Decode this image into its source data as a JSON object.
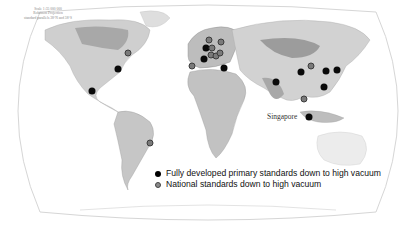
{
  "map": {
    "scale_note": [
      "Scale 1:35 000 000",
      "Robinson Projection",
      "standard parallels 38°N and 38°S"
    ],
    "labels": {
      "singapore": "Singapore"
    },
    "colors": {
      "land_light": "#d8d8d8",
      "land_mid": "#bcbcbc",
      "land_dark": "#9a9a9a",
      "ocean": "#ffffff",
      "primary_dot": "#0a0a0a",
      "national_dot": "#7a7a7a"
    },
    "dots": [
      {
        "type": "black",
        "x": 92,
        "y": 91
      },
      {
        "type": "black",
        "x": 118,
        "y": 69
      },
      {
        "type": "gray",
        "x": 128,
        "y": 53
      },
      {
        "type": "gray",
        "x": 150,
        "y": 143
      },
      {
        "type": "gray",
        "x": 192,
        "y": 66
      },
      {
        "type": "black",
        "x": 206,
        "y": 48
      },
      {
        "type": "black",
        "x": 204,
        "y": 59
      },
      {
        "type": "gray",
        "x": 209,
        "y": 40
      },
      {
        "type": "gray",
        "x": 212,
        "y": 48
      },
      {
        "type": "gray",
        "x": 221,
        "y": 42
      },
      {
        "type": "gray",
        "x": 211,
        "y": 55
      },
      {
        "type": "gray",
        "x": 216,
        "y": 56
      },
      {
        "type": "gray",
        "x": 220,
        "y": 53
      },
      {
        "type": "black",
        "x": 224,
        "y": 68
      },
      {
        "type": "black",
        "x": 276,
        "y": 82
      },
      {
        "type": "black",
        "x": 301,
        "y": 72
      },
      {
        "type": "gray",
        "x": 311,
        "y": 66
      },
      {
        "type": "black",
        "x": 326,
        "y": 71
      },
      {
        "type": "black",
        "x": 337,
        "y": 70
      },
      {
        "type": "black",
        "x": 324,
        "y": 87
      },
      {
        "type": "gray",
        "x": 304,
        "y": 99
      },
      {
        "type": "black",
        "x": 309,
        "y": 117
      }
    ]
  },
  "legend": {
    "items": [
      {
        "symbol": "black",
        "label": "Fully developed primary standards down to high vacuum"
      },
      {
        "symbol": "gray",
        "label": "National standards down to high vacuum"
      }
    ]
  }
}
